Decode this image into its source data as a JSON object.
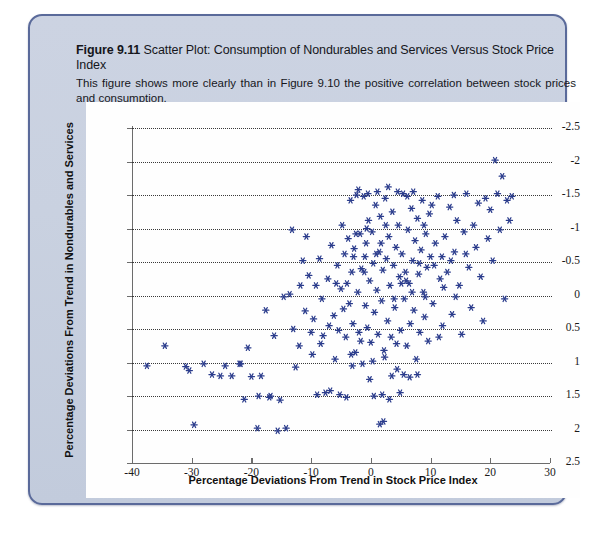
{
  "figure": {
    "number": "Figure 9.11",
    "title_rest": "Scatter Plot: Consumption of Nondurables and Services Versus Stock Price Index",
    "caption": "This figure shows more clearly than in Figure 9.10 the positive correlation between stock prices and consumption."
  },
  "chart_data": {
    "type": "scatter",
    "title": "Figure 9.11 Scatter Plot: Consumption of Nondurables and Services Versus Stock Price Index",
    "xlabel": "Percentage Deviations From Trend in Stock Price Index",
    "ylabel": "Percentage Deviations From Trend in Nondurables and Services",
    "xlim": [
      -40,
      30
    ],
    "ylim": [
      -2.5,
      2.5
    ],
    "xticks": [
      -40,
      -30,
      -20,
      -10,
      0,
      10,
      20,
      30
    ],
    "yticks": [
      -2.5,
      -2,
      -1.5,
      -1,
      -0.5,
      0,
      0.5,
      1,
      1.5,
      2,
      2.5
    ],
    "grid": "horizontal-dotted",
    "legend": "none",
    "marker": "asterisk",
    "marker_color": "#2b3c8c",
    "points": [
      [
        -37.5,
        -1.05
      ],
      [
        -34.5,
        -0.75
      ],
      [
        -31.0,
        -1.06
      ],
      [
        -30.4,
        -1.12
      ],
      [
        -29.6,
        -1.93
      ],
      [
        -28.0,
        -1.02
      ],
      [
        -26.6,
        -1.18
      ],
      [
        -25.2,
        -1.2
      ],
      [
        -23.3,
        -1.2
      ],
      [
        -22.0,
        -1.02
      ],
      [
        -21.2,
        -1.55
      ],
      [
        -20.6,
        -0.78
      ],
      [
        -20.0,
        -1.21
      ],
      [
        -19.0,
        -1.98
      ],
      [
        -18.4,
        -1.2
      ],
      [
        -17.6,
        -0.22
      ],
      [
        -17.0,
        -1.52
      ],
      [
        -16.2,
        -0.6
      ],
      [
        -15.6,
        -2.02
      ],
      [
        -15.2,
        -1.56
      ],
      [
        -14.6,
        -0.02
      ],
      [
        -14.2,
        -1.98
      ],
      [
        -13.6,
        0.02
      ],
      [
        -13.0,
        -0.5
      ],
      [
        -12.6,
        -1.07
      ],
      [
        -12.0,
        -0.75
      ],
      [
        -11.4,
        0.52
      ],
      [
        -11.0,
        -0.23
      ],
      [
        -10.4,
        0.3
      ],
      [
        -10.0,
        -0.55
      ],
      [
        -9.6,
        -0.35
      ],
      [
        -9.2,
        0.15
      ],
      [
        -9.0,
        -1.48
      ],
      [
        -8.6,
        0.55
      ],
      [
        -8.2,
        -0.05
      ],
      [
        -8.0,
        -0.6
      ],
      [
        -7.6,
        -1.45
      ],
      [
        -7.2,
        0.25
      ],
      [
        -7.0,
        -0.45
      ],
      [
        -6.6,
        0.75
      ],
      [
        -6.2,
        -0.3
      ],
      [
        -6.0,
        -0.95
      ],
      [
        -5.6,
        0.45
      ],
      [
        -5.4,
        -0.52
      ],
      [
        -5.0,
        0.1
      ],
      [
        -4.8,
        1.05
      ],
      [
        -4.6,
        -0.2
      ],
      [
        -4.4,
        0.62
      ],
      [
        -4.2,
        -0.62
      ],
      [
        -4.0,
        0.18
      ],
      [
        -3.8,
        0.85
      ],
      [
        -3.6,
        -0.12
      ],
      [
        -3.4,
        1.42
      ],
      [
        -3.2,
        0.35
      ],
      [
        -3.0,
        -0.42
      ],
      [
        -2.8,
        0.7
      ],
      [
        -2.6,
        -0.85
      ],
      [
        -2.4,
        1.5
      ],
      [
        -2.2,
        0.05
      ],
      [
        -2.0,
        -0.55
      ],
      [
        -1.8,
        0.92
      ],
      [
        -1.6,
        0.4
      ],
      [
        -1.4,
        -1.02
      ],
      [
        -1.2,
        1.48
      ],
      [
        -1.0,
        0.58
      ],
      [
        -0.9,
        -0.15
      ],
      [
        -0.8,
        0.78
      ],
      [
        -0.6,
        -0.48
      ],
      [
        -0.4,
        1.12
      ],
      [
        -0.2,
        0.22
      ],
      [
        0.0,
        -0.7
      ],
      [
        0.2,
        0.95
      ],
      [
        0.4,
        0.48
      ],
      [
        0.6,
        -0.25
      ],
      [
        0.8,
        1.35
      ],
      [
        1.0,
        0.08
      ],
      [
        1.2,
        -0.58
      ],
      [
        1.4,
        0.65
      ],
      [
        1.6,
        1.18
      ],
      [
        1.8,
        -0.08
      ],
      [
        2.0,
        0.38
      ],
      [
        2.2,
        -0.82
      ],
      [
        2.4,
        1.45
      ],
      [
        2.6,
        0.55
      ],
      [
        2.8,
        -0.38
      ],
      [
        3.0,
        0.88
      ],
      [
        3.2,
        0.15
      ],
      [
        3.4,
        -0.62
      ],
      [
        3.6,
        1.25
      ],
      [
        3.8,
        0.45
      ],
      [
        4.0,
        -0.18
      ],
      [
        4.2,
        0.72
      ],
      [
        4.4,
        -1.1
      ],
      [
        4.6,
        1.05
      ],
      [
        4.8,
        0.28
      ],
      [
        5.0,
        -0.52
      ],
      [
        5.2,
        0.62
      ],
      [
        5.4,
        1.52
      ],
      [
        5.6,
        -0.05
      ],
      [
        5.8,
        0.35
      ],
      [
        6.0,
        -0.75
      ],
      [
        6.2,
        0.98
      ],
      [
        6.4,
        0.18
      ],
      [
        6.6,
        -0.42
      ],
      [
        6.8,
        1.3
      ],
      [
        7.0,
        0.52
      ],
      [
        7.2,
        -0.22
      ],
      [
        7.4,
        0.82
      ],
      [
        7.6,
        -0.95
      ],
      [
        7.8,
        1.15
      ],
      [
        8.0,
        0.32
      ],
      [
        8.2,
        -0.55
      ],
      [
        8.4,
        0.68
      ],
      [
        8.6,
        1.42
      ],
      [
        8.8,
        0.05
      ],
      [
        9.0,
        -0.32
      ],
      [
        9.2,
        0.92
      ],
      [
        9.4,
        0.42
      ],
      [
        9.6,
        -0.68
      ],
      [
        9.8,
        1.22
      ],
      [
        10.0,
        0.58
      ],
      [
        10.4,
        -0.12
      ],
      [
        10.8,
        0.78
      ],
      [
        11.2,
        1.48
      ],
      [
        11.6,
        0.25
      ],
      [
        12.0,
        -0.45
      ],
      [
        12.4,
        0.88
      ],
      [
        12.8,
        0.35
      ],
      [
        13.2,
        1.32
      ],
      [
        13.6,
        -0.28
      ],
      [
        14.0,
        0.65
      ],
      [
        14.4,
        1.12
      ],
      [
        14.8,
        0.15
      ],
      [
        15.2,
        -0.58
      ],
      [
        15.6,
        0.95
      ],
      [
        16.0,
        1.52
      ],
      [
        16.4,
        0.42
      ],
      [
        16.8,
        -0.18
      ],
      [
        17.2,
        1.05
      ],
      [
        17.6,
        0.72
      ],
      [
        18.0,
        1.38
      ],
      [
        18.4,
        0.28
      ],
      [
        18.8,
        -0.38
      ],
      [
        19.2,
        1.45
      ],
      [
        19.6,
        0.85
      ],
      [
        20.0,
        1.28
      ],
      [
        20.4,
        0.52
      ],
      [
        20.8,
        2.02
      ],
      [
        21.2,
        1.52
      ],
      [
        21.6,
        0.98
      ],
      [
        22.0,
        1.78
      ],
      [
        22.4,
        -0.05
      ],
      [
        22.8,
        1.42
      ],
      [
        23.2,
        1.12
      ],
      [
        23.6,
        1.48
      ],
      [
        -2.1,
        1.58
      ],
      [
        -0.5,
        1.52
      ],
      [
        1.1,
        1.55
      ],
      [
        2.9,
        1.62
      ],
      [
        4.5,
        1.55
      ],
      [
        -13.2,
        0.98
      ],
      [
        -11.8,
        0.15
      ],
      [
        -10.8,
        0.88
      ],
      [
        -6.8,
        -1.42
      ],
      [
        -5.2,
        -1.48
      ],
      [
        -4.1,
        -1.52
      ],
      [
        -3.1,
        -1.05
      ],
      [
        0.5,
        -1.5
      ],
      [
        1.9,
        -1.48
      ],
      [
        3.1,
        -1.55
      ],
      [
        4.9,
        -1.45
      ],
      [
        -16.8,
        -1.5
      ],
      [
        -18.8,
        -1.5
      ],
      [
        -21.8,
        -1.02
      ],
      [
        -24.4,
        -1.05
      ],
      [
        1.5,
        -1.92
      ],
      [
        2.1,
        -1.88
      ],
      [
        -0.2,
        -1.25
      ],
      [
        3.5,
        -1.2
      ],
      [
        5.5,
        -1.18
      ],
      [
        6.5,
        -1.22
      ],
      [
        7.8,
        -1.18
      ],
      [
        -9.8,
        -0.88
      ],
      [
        -8.4,
        -0.72
      ],
      [
        5.9,
        0.22
      ],
      [
        3.9,
        -0.05
      ],
      [
        6.1,
        1.48
      ],
      [
        7.1,
        1.55
      ],
      [
        8.1,
        0.48
      ],
      [
        2.5,
        1.05
      ],
      [
        0.9,
        0.62
      ],
      [
        -1.1,
        0.35
      ],
      [
        -2.9,
        0.58
      ],
      [
        -5.8,
        0.18
      ],
      [
        9.1,
        -0.02
      ],
      [
        11.9,
        0.58
      ],
      [
        13.9,
        1.5
      ],
      [
        15.9,
        0.62
      ],
      [
        4.3,
        -0.72
      ],
      [
        2.3,
        -0.92
      ],
      [
        0.3,
        -0.98
      ],
      [
        -1.7,
        -0.68
      ],
      [
        -3.3,
        -0.88
      ],
      [
        8.9,
        1.05
      ],
      [
        10.2,
        1.35
      ],
      [
        12.2,
        0.12
      ],
      [
        14.2,
        -0.02
      ],
      [
        6.9,
        0.05
      ],
      [
        5.1,
        0.18
      ],
      [
        1.7,
        0.78
      ],
      [
        -0.7,
        1.0
      ],
      [
        -2.5,
        0.92
      ],
      [
        10.6,
        0.45
      ],
      [
        11.4,
        -0.62
      ],
      [
        13.4,
        0.52
      ]
    ]
  },
  "axis": {
    "xticks": [
      "-40",
      "-30",
      "-20",
      "-10",
      "0",
      "10",
      "20",
      "30"
    ],
    "yticks": [
      "2.5",
      "2",
      "1.5",
      "1",
      "0.5",
      "0",
      "-0.5",
      "-1",
      "-1.5",
      "-2",
      "-2.5"
    ]
  }
}
